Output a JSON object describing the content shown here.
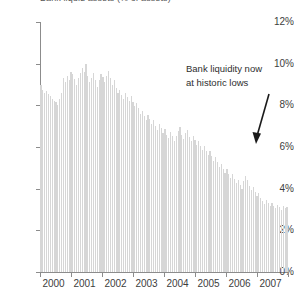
{
  "chart_data": {
    "type": "bar",
    "title": "Bank liquid assets (% of assets)",
    "xlabel": "",
    "ylabel": "",
    "ylim": [
      0,
      12
    ],
    "y_ticks": [
      0,
      2,
      4,
      6,
      8,
      10,
      12
    ],
    "y_tick_labels": [
      "0%",
      "2%",
      "4%",
      "6%",
      "8%",
      "10%",
      "12%"
    ],
    "x_tick_labels": [
      "2000",
      "2001",
      "2002",
      "2003",
      "2004",
      "2005",
      "2006",
      "2007"
    ],
    "grid": false,
    "legend": null,
    "bar_color": "#d6d6d6",
    "annotations": [
      {
        "text_lines": [
          "Bank liquidity now",
          "at historic lows"
        ],
        "arrow": true,
        "arrow_target_year": 2006.9,
        "arrow_target_value": 4.4
      }
    ],
    "x_start": 2000.0,
    "x_step": 0.0833333,
    "values": [
      9.0,
      8.75,
      8.6,
      8.7,
      8.55,
      8.45,
      8.3,
      8.2,
      8.15,
      8.0,
      8.3,
      8.6,
      9.3,
      9.1,
      9.4,
      9.2,
      9.6,
      9.5,
      9.25,
      9.0,
      9.3,
      9.55,
      9.8,
      9.6,
      10.0,
      9.4,
      9.1,
      9.3,
      9.55,
      9.2,
      8.9,
      9.2,
      9.5,
      9.35,
      9.1,
      9.4,
      9.65,
      9.3,
      9.0,
      9.2,
      8.85,
      8.6,
      8.75,
      8.5,
      8.3,
      8.6,
      8.4,
      8.2,
      8.45,
      8.15,
      7.95,
      8.1,
      7.85,
      7.6,
      7.75,
      7.5,
      7.3,
      7.55,
      7.35,
      7.1,
      7.3,
      7.0,
      6.8,
      7.1,
      6.9,
      6.65,
      6.85,
      6.6,
      6.45,
      6.7,
      6.55,
      6.3,
      6.55,
      6.75,
      6.95,
      6.6,
      6.4,
      6.65,
      6.8,
      6.5,
      6.3,
      6.55,
      6.35,
      6.1,
      6.3,
      6.05,
      5.85,
      6.05,
      5.8,
      5.6,
      5.8,
      5.55,
      5.35,
      5.5,
      5.3,
      5.05,
      5.2,
      4.95,
      4.75,
      4.95,
      4.7,
      4.5,
      4.7,
      4.45,
      4.25,
      4.4,
      4.2,
      4.0,
      4.35,
      4.6,
      4.4,
      4.15,
      3.95,
      4.1,
      3.85,
      3.65,
      3.8,
      3.55,
      3.4,
      3.25,
      3.45,
      3.3,
      3.15,
      3.3,
      3.15,
      3.05,
      3.2,
      3.1,
      3.0,
      3.15,
      3.05,
      3.1
    ]
  }
}
